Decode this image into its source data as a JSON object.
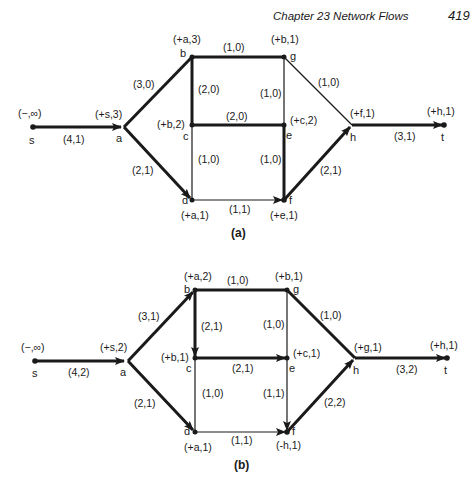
{
  "page_header": {
    "chapter": "Chapter 23   Network Flows",
    "page_number": "419"
  },
  "diagram_a": {
    "caption": "(a)",
    "nodes": {
      "s": {
        "name": "s",
        "label": "(−,∞)"
      },
      "a": {
        "name": "a",
        "label": "(+s,3)"
      },
      "b": {
        "name": "b",
        "label": "(+a,3)"
      },
      "g": {
        "name": "g",
        "label": "(+b,1)"
      },
      "c": {
        "name": "c",
        "label": "(+b,2)"
      },
      "e": {
        "name": "e",
        "label": "(+c,2)"
      },
      "d": {
        "name": "d",
        "label": "(+a,1)"
      },
      "f": {
        "name": "f",
        "label": "(+e,1)"
      },
      "h": {
        "name": "h",
        "label": "(+f,1)"
      },
      "t": {
        "name": "t",
        "label": "(+h,1)"
      }
    },
    "edges": {
      "s_a": "(4,1)",
      "a_b": "(3,0)",
      "a_d": "(2,1)",
      "b_g": "(1,0)",
      "b_c": "(2,0)",
      "g_e": "(1,0)",
      "g_h": "(1,0)",
      "c_e": "(2,0)",
      "c_d": "(1,0)",
      "e_f": "(1,0)",
      "d_f": "(1,1)",
      "f_h": "(2,1)",
      "h_t": "(3,1)"
    }
  },
  "diagram_b": {
    "caption": "(b)",
    "nodes": {
      "s": {
        "name": "s",
        "label": "(−,∞)"
      },
      "a": {
        "name": "a",
        "label": "(+s,2)"
      },
      "b": {
        "name": "b",
        "label": "(+a,2)"
      },
      "g": {
        "name": "g",
        "label": "(+b,1)"
      },
      "c": {
        "name": "c",
        "label": "(+b,1)"
      },
      "e": {
        "name": "e",
        "label": "(+c,1)"
      },
      "d": {
        "name": "d",
        "label": "(+a,1)"
      },
      "f": {
        "name": "f",
        "label": "(-h,1)"
      },
      "h": {
        "name": "h",
        "label": "(+g,1)"
      },
      "t": {
        "name": "t",
        "label": "(+h,1)"
      }
    },
    "edges": {
      "s_a": "(4,2)",
      "a_b": "(3,1)",
      "a_d": "(2,1)",
      "b_g": "(1,0)",
      "b_c": "(2,1)",
      "g_e": "(1,0)",
      "g_h": "(1,0)",
      "c_e": "(2,1)",
      "c_d": "(1,0)",
      "e_f": "(1,1)",
      "d_f": "(1,1)",
      "f_h": "(2,2)",
      "h_t": "(3,2)"
    }
  }
}
